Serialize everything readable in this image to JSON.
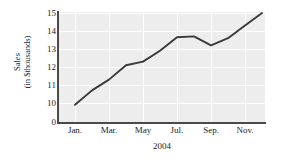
{
  "chart_data": {
    "type": "line",
    "title": "",
    "subtitle": "",
    "xlabel": "2004",
    "ylabel": "Sales (in $thousands)",
    "ylabel_lines": [
      "Sales",
      "(in $thousands)"
    ],
    "categories": [
      "Jan.",
      "Feb.",
      "Mar.",
      "Apr.",
      "May",
      "Jun.",
      "Jul.",
      "Aug.",
      "Sep.",
      "Oct.",
      "Nov.",
      "Dec."
    ],
    "values": [
      9.9,
      10.7,
      11.3,
      12.1,
      12.3,
      12.9,
      13.65,
      13.7,
      13.2,
      13.6,
      14.3,
      15.0
    ],
    "x_tick_labels": [
      "Jan.",
      "Mar.",
      "May",
      "Jul.",
      "Sep.",
      "Nov."
    ],
    "x_tick_indices": [
      0,
      2,
      4,
      6,
      8,
      10
    ],
    "y_tick_labels": [
      "15",
      "14",
      "13",
      "12",
      "11",
      "10",
      "0"
    ],
    "y_tick_values": [
      15,
      14,
      13,
      12,
      11,
      10,
      0
    ],
    "ylim": [
      9.5,
      15.2
    ],
    "axis_break": true,
    "grid": true,
    "grid_color": "#ffffff",
    "plot_background": "#ededed",
    "line_color": "#3a3a3a",
    "axis_color": "#4a4a4a",
    "legend": null,
    "legend_position": "none",
    "annotations": []
  },
  "figure": {
    "background": "#ffffff",
    "text_color": "#1e1e1e"
  }
}
